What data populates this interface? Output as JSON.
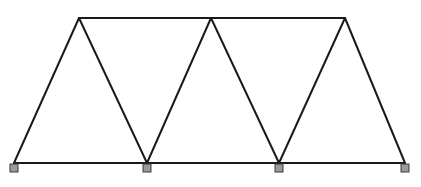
{
  "diagram": {
    "type": "truss",
    "colors": {
      "member": "#1a1a1a",
      "support_fill": "#9a9a9a",
      "support_stroke": "#3a3a3a",
      "background": "#ffffff"
    },
    "nodes": [
      {
        "id": "B1",
        "x": 14,
        "y": 163
      },
      {
        "id": "B2",
        "x": 147,
        "y": 163
      },
      {
        "id": "B3",
        "x": 279,
        "y": 163
      },
      {
        "id": "B4",
        "x": 405,
        "y": 163
      },
      {
        "id": "T1",
        "x": 79,
        "y": 18
      },
      {
        "id": "T2",
        "x": 211,
        "y": 18
      },
      {
        "id": "T3",
        "x": 345,
        "y": 18
      }
    ],
    "members": [
      {
        "from": "B1",
        "to": "B4",
        "kind": "bottom-chord"
      },
      {
        "from": "T1",
        "to": "T3",
        "kind": "top-chord"
      },
      {
        "from": "B1",
        "to": "T1",
        "kind": "diagonal"
      },
      {
        "from": "T1",
        "to": "B2",
        "kind": "diagonal"
      },
      {
        "from": "B2",
        "to": "T2",
        "kind": "diagonal"
      },
      {
        "from": "T2",
        "to": "B3",
        "kind": "diagonal"
      },
      {
        "from": "B3",
        "to": "T3",
        "kind": "diagonal"
      },
      {
        "from": "T3",
        "to": "B4",
        "kind": "diagonal"
      }
    ],
    "supports": [
      {
        "at": "B1",
        "size": 8
      },
      {
        "at": "B2",
        "size": 8
      },
      {
        "at": "B3",
        "size": 8
      },
      {
        "at": "B4",
        "size": 8
      }
    ]
  }
}
